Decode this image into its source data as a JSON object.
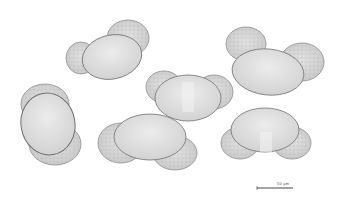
{
  "image": {
    "description": "Light micrograph of bisaccate pollen grains on white background",
    "background": "#ffffff",
    "grain_count": 6
  },
  "grains": [
    {
      "id": "grain-1",
      "position": "top-left"
    },
    {
      "id": "grain-2",
      "position": "top-right"
    },
    {
      "id": "grain-3",
      "position": "center"
    },
    {
      "id": "grain-4",
      "position": "left"
    },
    {
      "id": "grain-5",
      "position": "bottom-center"
    },
    {
      "id": "grain-6",
      "position": "bottom-right"
    }
  ],
  "scale_bar": {
    "label": "50 µm",
    "color": "#333333"
  }
}
